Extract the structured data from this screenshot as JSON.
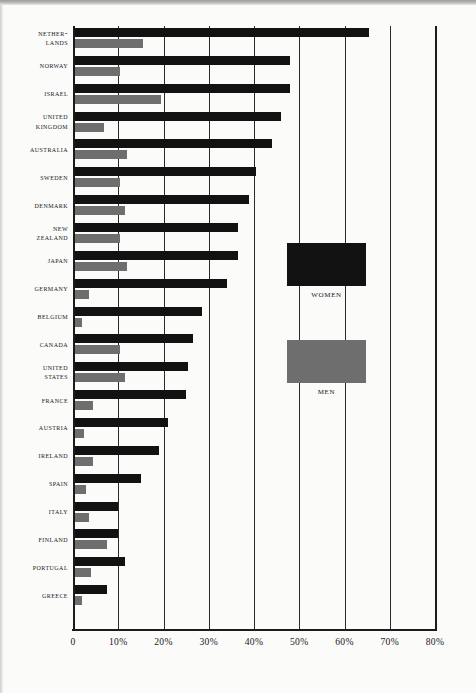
{
  "chart_data": {
    "type": "bar",
    "orientation": "horizontal",
    "title": "",
    "xlabel": "",
    "ylabel": "",
    "xlim": [
      0,
      80
    ],
    "xticks": [
      0,
      10,
      20,
      30,
      40,
      50,
      60,
      70,
      80
    ],
    "xtick_labels": [
      "0",
      "10%",
      "20%",
      "30%",
      "40%",
      "50%",
      "60%",
      "70%",
      "80%"
    ],
    "grid": true,
    "grid_axis": "x",
    "legend_position": "center-right-inside",
    "categories": [
      "Nether-lands",
      "Norway",
      "Israel",
      "United Kingdom",
      "Australia",
      "Sweden",
      "Denmark",
      "New Zealand",
      "Japan",
      "Germany",
      "Belgium",
      "Canada",
      "United States",
      "France",
      "Austria",
      "Ireland",
      "Spain",
      "Italy",
      "Finland",
      "Portugal",
      "Greece"
    ],
    "category_lines": [
      [
        "Nether-",
        "lands"
      ],
      [
        "Norway"
      ],
      [
        "Israel"
      ],
      [
        "United",
        "Kingdom"
      ],
      [
        "Australia"
      ],
      [
        "Sweden"
      ],
      [
        "Denmark"
      ],
      [
        "New",
        "Zealand"
      ],
      [
        "Japan"
      ],
      [
        "Germany"
      ],
      [
        "Belgium"
      ],
      [
        "Canada"
      ],
      [
        "United",
        "States"
      ],
      [
        "France"
      ],
      [
        "Austria"
      ],
      [
        "Ireland"
      ],
      [
        "Spain"
      ],
      [
        "Italy"
      ],
      [
        "Finland"
      ],
      [
        "Portugal"
      ],
      [
        "Greece"
      ]
    ],
    "series": [
      {
        "name": "Women",
        "color": "#121212",
        "values": [
          65,
          47.5,
          47.5,
          45.5,
          43.5,
          40,
          38.5,
          36,
          36,
          33.5,
          28,
          26,
          25,
          24.5,
          20.5,
          18.5,
          14.5,
          9.5,
          9.5,
          11,
          7
        ]
      },
      {
        "name": "Men",
        "color": "#6e6e6e",
        "values": [
          15,
          10,
          19,
          6.5,
          11.5,
          10,
          11,
          10,
          11.5,
          3,
          1.5,
          10,
          11,
          4,
          2,
          4,
          2.5,
          3,
          7,
          3.5,
          1.5
        ]
      }
    ]
  },
  "legend": {
    "items": [
      {
        "label": "Women",
        "color": "#121212"
      },
      {
        "label": "Men",
        "color": "#6e6e6e"
      }
    ]
  }
}
